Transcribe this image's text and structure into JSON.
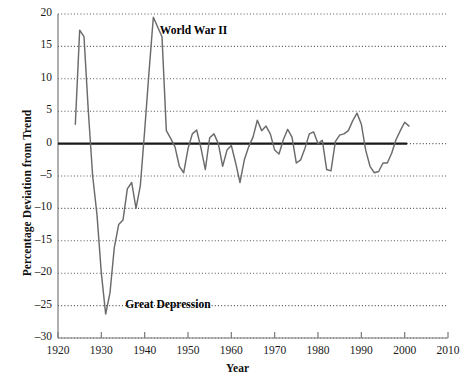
{
  "chart_data": {
    "type": "line",
    "title": "",
    "xlabel": "Year",
    "ylabel": "Percentage Deviation from Trend",
    "xlim": [
      1920,
      2010
    ],
    "ylim": [
      -30,
      20
    ],
    "xticks": [
      1920,
      1930,
      1940,
      1950,
      1960,
      1970,
      1980,
      1990,
      2000,
      2010
    ],
    "yticks": [
      20,
      15,
      10,
      5,
      0,
      -5,
      -10,
      -15,
      -20,
      -25,
      -30
    ],
    "ytick_labels": [
      "20",
      "15",
      "10",
      "5",
      "0",
      "–5",
      "–10",
      "–15",
      "–20",
      "–25",
      "–30"
    ],
    "xtick_labels": [
      "1920",
      "1930",
      "1940",
      "1950",
      "1960",
      "1970",
      "1980",
      "1990",
      "2000",
      "2010"
    ],
    "grid": true,
    "grid_style": "dotted",
    "zero_line": true,
    "legend": "none",
    "line_color": "#6b6b6b",
    "zero_line_color": "#1a1a1a",
    "grid_color": "#555555",
    "axis_color": "#7a7a7a",
    "annotations": [
      {
        "text": "World War II",
        "x": 1943.5,
        "y": 17.2
      },
      {
        "text": "Great Depression",
        "x": 1935.5,
        "y": -25.0
      }
    ],
    "series": [
      {
        "name": "Percentage Deviation from Trend",
        "x": [
          1924,
          1925,
          1926,
          1927,
          1928,
          1929,
          1930,
          1931,
          1932,
          1933,
          1934,
          1935,
          1936,
          1937,
          1938,
          1939,
          1940,
          1941,
          1942,
          1943,
          1944,
          1945,
          1946,
          1947,
          1948,
          1949,
          1950,
          1951,
          1952,
          1953,
          1954,
          1955,
          1956,
          1957,
          1958,
          1959,
          1960,
          1961,
          1962,
          1963,
          1964,
          1965,
          1966,
          1967,
          1968,
          1969,
          1970,
          1971,
          1972,
          1973,
          1974,
          1975,
          1976,
          1977,
          1978,
          1979,
          1980,
          1981,
          1982,
          1983,
          1984,
          1985,
          1986,
          1987,
          1988,
          1989,
          1990,
          1991,
          1992,
          1993,
          1994,
          1995,
          1996,
          1997,
          1998,
          1999,
          2000,
          2001
        ],
        "values": [
          3.0,
          17.5,
          16.5,
          5.0,
          -5.0,
          -11.0,
          -20.0,
          -26.3,
          -23.0,
          -16.0,
          -12.5,
          -11.8,
          -7.0,
          -6.0,
          -10.0,
          -6.5,
          2.0,
          11.0,
          19.5,
          18.0,
          16.5,
          2.0,
          0.8,
          -0.5,
          -3.5,
          -4.5,
          -0.8,
          1.5,
          2.1,
          -0.7,
          -4.0,
          0.9,
          1.5,
          0.0,
          -3.5,
          -1.0,
          -0.3,
          -3.0,
          -6.0,
          -2.5,
          -0.5,
          1.0,
          3.6,
          2.0,
          2.7,
          1.5,
          -1.0,
          -1.6,
          0.6,
          2.2,
          1.0,
          -3.0,
          -2.5,
          -0.7,
          1.5,
          1.8,
          0.0,
          0.5,
          -4.0,
          -4.2,
          0.3,
          1.3,
          1.5,
          2.0,
          3.5,
          4.7,
          3.0,
          -1.0,
          -3.5,
          -4.5,
          -4.3,
          -3.0,
          -3.0,
          -1.5,
          0.6,
          2.0,
          3.3,
          2.7
        ]
      }
    ]
  }
}
